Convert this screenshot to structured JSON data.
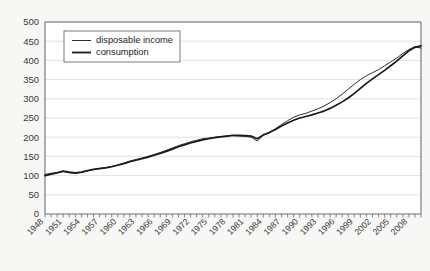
{
  "chart_data": {
    "type": "line",
    "title": "",
    "xlabel": "",
    "ylabel": "",
    "ylim": [
      0,
      500
    ],
    "ytick_step": 50,
    "yticks": [
      "0",
      "50",
      "100",
      "150",
      "200",
      "250",
      "300",
      "350",
      "400",
      "450",
      "500"
    ],
    "xlim": [
      1948,
      2010
    ],
    "xtick_step": 1,
    "xlabel_step": 3,
    "xticklabels": [
      "1948",
      "1951",
      "1954",
      "1957",
      "1960",
      "1963",
      "1966",
      "1969",
      "1972",
      "1975",
      "1978",
      "1981",
      "1984",
      "1987",
      "1990",
      "1993",
      "1996",
      "1999",
      "2002",
      "2005",
      "2008"
    ],
    "grid": "horizontal",
    "legend_position": "upper-left",
    "x": [
      1948,
      1949,
      1950,
      1951,
      1952,
      1953,
      1954,
      1955,
      1956,
      1957,
      1958,
      1959,
      1960,
      1961,
      1962,
      1963,
      1964,
      1965,
      1966,
      1967,
      1968,
      1969,
      1970,
      1971,
      1972,
      1973,
      1974,
      1975,
      1976,
      1977,
      1978,
      1979,
      1980,
      1981,
      1982,
      1983,
      1984,
      1985,
      1986,
      1987,
      1988,
      1989,
      1990,
      1991,
      1992,
      1993,
      1994,
      1995,
      1996,
      1997,
      1998,
      1999,
      2000,
      2001,
      2002,
      2003,
      2004,
      2005,
      2006,
      2007,
      2008,
      2009,
      2010
    ],
    "series": [
      {
        "name": "disposable income",
        "values": [
          103,
          106,
          108,
          110,
          107,
          106,
          108,
          112,
          116,
          119,
          121,
          124,
          128,
          133,
          138,
          142,
          146,
          150,
          155,
          160,
          166,
          172,
          178,
          183,
          188,
          192,
          196,
          198,
          200,
          202,
          203,
          204,
          203,
          202,
          200,
          190,
          205,
          213,
          222,
          233,
          243,
          252,
          258,
          262,
          268,
          274,
          281,
          290,
          300,
          312,
          325,
          338,
          350,
          360,
          368,
          376,
          386,
          396,
          406,
          418,
          428,
          436,
          432
        ]
      },
      {
        "name": "consumption",
        "values": [
          100,
          104,
          107,
          112,
          109,
          107,
          109,
          113,
          116,
          118,
          120,
          123,
          127,
          131,
          136,
          140,
          144,
          148,
          153,
          158,
          163,
          169,
          175,
          180,
          185,
          189,
          193,
          196,
          199,
          201,
          203,
          205,
          205,
          204,
          203,
          196,
          206,
          212,
          220,
          229,
          237,
          244,
          250,
          254,
          258,
          263,
          268,
          275,
          283,
          292,
          302,
          314,
          327,
          340,
          352,
          363,
          374,
          386,
          398,
          412,
          425,
          434,
          438
        ]
      }
    ]
  },
  "legend": {
    "items": [
      {
        "label": "disposable income",
        "key": "disposable"
      },
      {
        "label": "consumption",
        "key": "consumption"
      }
    ]
  },
  "colors": {
    "disposable_income": "#2b2b2b",
    "consumption": "#1a1a1a",
    "gridline": "#d9d9d9",
    "axis": "#6e6e6e",
    "plot_background": "#ffffff",
    "page_background": "#f7f7f5"
  }
}
